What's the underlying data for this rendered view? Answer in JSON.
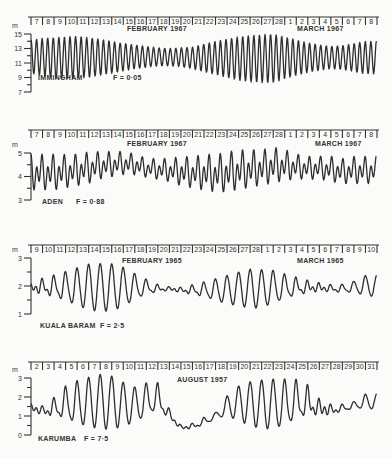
{
  "figure": {
    "unit_label": "m",
    "panels": [
      {
        "station": "IMMINGHAM",
        "form_factor": "F = 0·05",
        "month_labels": [
          "FEBRUARY 1967",
          "MARCH 1967"
        ],
        "days": [
          "7",
          "8",
          "9",
          "10",
          "11",
          "12",
          "13",
          "14",
          "15",
          "16",
          "17",
          "18",
          "19",
          "20",
          "21",
          "22",
          "23",
          "24",
          "25",
          "26",
          "27",
          "28",
          "1",
          "2",
          "3",
          "4",
          "5",
          "6",
          "7",
          "8"
        ],
        "y_ticks": [
          "15",
          "13",
          "11",
          "9",
          "7"
        ]
      },
      {
        "station": "ADEN",
        "form_factor": "F = 0·88",
        "month_labels": [
          "FEBRUARY 1967",
          "MARCH 1967"
        ],
        "days": [
          "7",
          "8",
          "9",
          "10",
          "11",
          "12",
          "13",
          "14",
          "15",
          "16",
          "17",
          "18",
          "19",
          "20",
          "21",
          "22",
          "23",
          "24",
          "25",
          "26",
          "27",
          "28",
          "1",
          "2",
          "3",
          "4",
          "5",
          "6",
          "7",
          "8"
        ],
        "y_ticks": [
          "5",
          "4",
          "3"
        ]
      },
      {
        "station": "KUALA BARAM",
        "form_factor": "F = 2·5",
        "month_labels": [
          "FEBRUARY 1965",
          "MARCH 1965"
        ],
        "days": [
          "9",
          "10",
          "11",
          "12",
          "13",
          "14",
          "15",
          "16",
          "17",
          "18",
          "19",
          "20",
          "21",
          "22",
          "23",
          "24",
          "25",
          "26",
          "27",
          "28",
          "1",
          "2",
          "3",
          "4",
          "5",
          "6",
          "7",
          "8",
          "9",
          "10"
        ],
        "y_ticks": [
          "3",
          "2",
          "1"
        ]
      },
      {
        "station": "KARUMBA",
        "form_factor": "F = 7·5",
        "month_labels": [
          "AUGUST 1957"
        ],
        "days": [
          "2",
          "3",
          "4",
          "5",
          "6",
          "7",
          "8",
          "9",
          "10",
          "11",
          "12",
          "13",
          "14",
          "15",
          "16",
          "17",
          "18",
          "19",
          "20",
          "21",
          "22",
          "23",
          "24",
          "25",
          "26",
          "27",
          "28",
          "29",
          "30",
          "31"
        ],
        "y_ticks": [
          "3",
          "2",
          "1",
          "0"
        ]
      }
    ]
  },
  "chart_data": [
    {
      "type": "line",
      "title": "IMMINGHAM  F = 0·05",
      "xlabel": "FEBRUARY 1967 – MARCH 1967 (days 7 Feb – 8 Mar)",
      "ylabel": "m",
      "ylim": [
        7,
        15
      ],
      "y_ticks": [
        15,
        13,
        11,
        9,
        7
      ],
      "x_ticks": [
        "7",
        "8",
        "9",
        "10",
        "11",
        "12",
        "13",
        "14",
        "15",
        "16",
        "17",
        "18",
        "19",
        "20",
        "21",
        "22",
        "23",
        "24",
        "25",
        "26",
        "27",
        "28",
        "1",
        "2",
        "3",
        "4",
        "5",
        "6",
        "7",
        "8"
      ],
      "description": "Semidiurnal tide, two highs per day. Spring range near 7–13 Feb (high ~14.5 m, low ~9 m), neap near 17–21 Feb (high ~13 m, low ~10.5 m), spring again 26 Feb – 1 Mar (high ~15 m, low ~8.2 m), neap ~5–6 Mar.",
      "series": [
        {
          "name": "daily high water (m)",
          "values": [
            14.2,
            14.4,
            14.5,
            14.6,
            14.7,
            14.5,
            14.3,
            14.0,
            13.7,
            13.5,
            13.3,
            13.1,
            13.0,
            13.1,
            13.2,
            13.6,
            14.0,
            14.3,
            14.6,
            14.8,
            14.9,
            15.0,
            14.6,
            14.2,
            13.8,
            13.5,
            13.3,
            13.4,
            13.7,
            14.0
          ]
        },
        {
          "name": "daily low water (m)",
          "values": [
            9.6,
            9.2,
            8.9,
            8.8,
            8.9,
            9.0,
            9.3,
            9.6,
            9.9,
            10.2,
            10.4,
            10.6,
            10.6,
            10.5,
            10.2,
            9.8,
            9.4,
            9.0,
            8.6,
            8.4,
            8.3,
            8.3,
            8.8,
            9.3,
            9.7,
            10.0,
            10.2,
            10.1,
            9.8,
            9.5
          ]
        }
      ]
    },
    {
      "type": "line",
      "title": "ADEN  F = 0·88",
      "xlabel": "FEBRUARY 1967 – MARCH 1967 (days 7 Feb – 8 Mar)",
      "ylabel": "m",
      "ylim": [
        3,
        5
      ],
      "y_ticks": [
        5,
        4,
        3
      ],
      "x_ticks": [
        "7",
        "8",
        "9",
        "10",
        "11",
        "12",
        "13",
        "14",
        "15",
        "16",
        "17",
        "18",
        "19",
        "20",
        "21",
        "22",
        "23",
        "24",
        "25",
        "26",
        "27",
        "28",
        "1",
        "2",
        "3",
        "4",
        "5",
        "6",
        "7",
        "8"
      ],
      "description": "Mixed, mainly semidiurnal tide with strong diurnal inequality; lower lows reach ~3.2 m, highs ~5.0–5.3 m.",
      "series": [
        {
          "name": "daily high water (m)",
          "values": [
            5.0,
            5.0,
            5.0,
            5.0,
            5.0,
            5.1,
            5.1,
            5.1,
            5.1,
            5.0,
            4.8,
            4.8,
            4.8,
            4.9,
            4.9,
            5.0,
            5.0,
            5.1,
            5.2,
            5.2,
            5.2,
            5.3,
            5.2,
            5.0,
            4.9,
            4.9,
            4.9,
            4.8,
            4.9,
            4.9
          ]
        },
        {
          "name": "daily lower low water (m)",
          "values": [
            3.3,
            3.3,
            3.3,
            3.4,
            3.5,
            3.6,
            3.8,
            3.9,
            4.0,
            4.0,
            3.9,
            3.8,
            3.7,
            3.5,
            3.4,
            3.3,
            3.2,
            3.2,
            3.3,
            3.4,
            3.5,
            3.6,
            3.7,
            3.8,
            3.8,
            3.8,
            3.7,
            3.6,
            3.6,
            3.6
          ]
        }
      ]
    },
    {
      "type": "line",
      "title": "KUALA BARAM  F = 2·5",
      "xlabel": "FEBRUARY 1965 – MARCH 1965 (days 9 Feb – 10 Mar)",
      "ylabel": "m",
      "ylim": [
        1,
        3
      ],
      "y_ticks": [
        3,
        2,
        1
      ],
      "x_ticks": [
        "9",
        "10",
        "11",
        "12",
        "13",
        "14",
        "15",
        "16",
        "17",
        "18",
        "19",
        "20",
        "21",
        "22",
        "23",
        "24",
        "25",
        "26",
        "27",
        "28",
        "1",
        "2",
        "3",
        "4",
        "5",
        "6",
        "7",
        "8",
        "9",
        "10"
      ],
      "description": "Mixed, mainly diurnal tide. Large diurnal range around 13–17 Feb (high ~2.8 m, low ~1.1 m) and 28 Feb – 4 Mar; small semidiurnal oscillations near 20–24 Feb and 6–9 Mar.",
      "series": [
        {
          "name": "daily high water (m)",
          "values": [
            2.2,
            2.4,
            2.5,
            2.6,
            2.7,
            2.8,
            2.8,
            2.8,
            2.7,
            2.5,
            2.3,
            2.1,
            2.0,
            2.0,
            2.1,
            2.2,
            2.3,
            2.4,
            2.5,
            2.6,
            2.6,
            2.6,
            2.5,
            2.4,
            2.3,
            2.2,
            2.1,
            2.1,
            2.2,
            2.4
          ]
        },
        {
          "name": "daily low water (m)",
          "values": [
            1.7,
            1.5,
            1.4,
            1.3,
            1.2,
            1.1,
            1.1,
            1.1,
            1.2,
            1.4,
            1.6,
            1.7,
            1.8,
            1.7,
            1.6,
            1.5,
            1.4,
            1.3,
            1.3,
            1.2,
            1.2,
            1.3,
            1.4,
            1.5,
            1.6,
            1.7,
            1.7,
            1.7,
            1.7,
            1.6
          ]
        }
      ]
    },
    {
      "type": "line",
      "title": "KARUMBA  F = 7·5",
      "xlabel": "AUGUST 1957 (days 2 – 31)",
      "ylabel": "m",
      "ylim": [
        0,
        3
      ],
      "y_ticks": [
        3,
        2,
        1,
        0
      ],
      "x_ticks": [
        "2",
        "3",
        "4",
        "5",
        "6",
        "7",
        "8",
        "9",
        "10",
        "11",
        "12",
        "13",
        "14",
        "15",
        "16",
        "17",
        "18",
        "19",
        "20",
        "21",
        "22",
        "23",
        "24",
        "25",
        "26",
        "27",
        "28",
        "29",
        "30",
        "31"
      ],
      "description": "Diurnal tide, one high per day. Large range 5–13 Aug (high ~3.2 m, low ~0.3 m), near-flat 14–18 Aug (~0.2–1.0 m), large again 19–27 Aug (high ~3.2 m), smaller 28–31 Aug.",
      "series": [
        {
          "name": "daily high water (m)",
          "values": [
            1.8,
            1.7,
            2.2,
            2.8,
            3.0,
            3.1,
            3.2,
            3.1,
            2.8,
            2.6,
            2.9,
            3.0,
            1.5,
            0.6,
            0.7,
            1.0,
            1.2,
            2.1,
            2.6,
            2.8,
            2.9,
            3.0,
            3.1,
            3.2,
            3.0,
            2.2,
            1.8,
            1.7,
            1.8,
            2.2
          ]
        },
        {
          "name": "daily low water (m)",
          "values": [
            1.1,
            0.8,
            0.6,
            0.4,
            0.3,
            0.3,
            0.3,
            0.3,
            0.4,
            0.5,
            0.7,
            0.9,
            0.6,
            0.2,
            0.2,
            0.4,
            0.8,
            0.9,
            0.7,
            0.5,
            0.3,
            0.2,
            0.2,
            0.3,
            0.4,
            0.6,
            0.8,
            1.1,
            1.3,
            1.3
          ]
        }
      ]
    }
  ]
}
